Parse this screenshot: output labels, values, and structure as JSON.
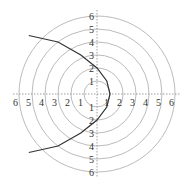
{
  "chart_data": {
    "type": "line",
    "title": "",
    "coordinate_system": "polar",
    "equation": "r = 2/(1+cos θ)",
    "rings": [
      1,
      2,
      3,
      4,
      5,
      6
    ],
    "x_tick_labels": [
      "6",
      "5",
      "4",
      "3",
      "2",
      "1",
      "1",
      "2",
      "3",
      "4",
      "5",
      "6"
    ],
    "y_tick_labels": [
      "6",
      "5",
      "4",
      "3",
      "2",
      "1",
      "1",
      "2",
      "3",
      "4",
      "5",
      "6"
    ],
    "xlim": [
      -6,
      6
    ],
    "ylim": [
      -6,
      6
    ],
    "series": [
      {
        "name": "parabola",
        "points": [
          [
            -5.25,
            4.5
          ],
          [
            -3,
            4
          ],
          [
            -1.25,
            3
          ],
          [
            0,
            2
          ],
          [
            0.75,
            1
          ],
          [
            1,
            0
          ],
          [
            0.75,
            -1
          ],
          [
            0,
            -2
          ],
          [
            -1.25,
            -3
          ],
          [
            -3,
            -4
          ],
          [
            -5.25,
            -4.5
          ]
        ]
      }
    ],
    "grid": true
  },
  "colors": {
    "grid": "#aaaaaa",
    "curve": "#333333",
    "axis": "#888888"
  }
}
